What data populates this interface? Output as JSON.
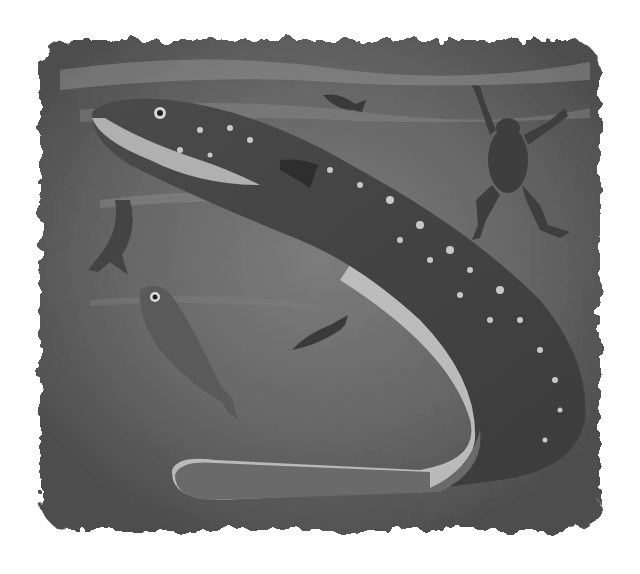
{
  "image": {
    "subject": "Electric eel hunting underwater with small fish and a frog",
    "style": "grayscale painted illustration with vignette edges",
    "colors": {
      "background": "#ffffff",
      "water_dark": "#4a4a4a",
      "water_mid": "#6e6e6e",
      "water_light": "#9a9a9a",
      "eel_body": "#5a5a5a",
      "eel_belly": "#b8b8b8",
      "eel_spots": "#c8c8c8",
      "fin": "#d0d0d0"
    },
    "elements": [
      {
        "name": "electric-eel",
        "description": "large spotted eel curving from upper-left down to a looping tail at bottom"
      },
      {
        "name": "fish-top",
        "description": "small dark fish near top center"
      },
      {
        "name": "frog",
        "description": "frog swimming upward at right"
      },
      {
        "name": "fish-left",
        "description": "small fish partly hidden at left"
      },
      {
        "name": "fish-stunned",
        "description": "stunned fish tilted downward at lower left"
      },
      {
        "name": "fish-small-center",
        "description": "small fish at center"
      }
    ]
  }
}
